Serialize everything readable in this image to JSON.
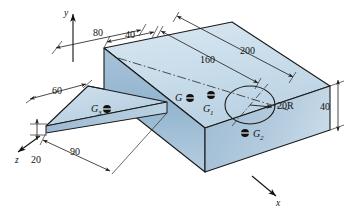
{
  "figure": {
    "axes": [
      {
        "name": "y-axis-label",
        "label": "y"
      },
      {
        "name": "x-axis-label",
        "label": "x"
      },
      {
        "name": "z-axis-label",
        "label": "z"
      }
    ],
    "dimensions": [
      {
        "name": "dim-80",
        "label": "80"
      },
      {
        "name": "dim-40-top",
        "label": "40"
      },
      {
        "name": "dim-160",
        "label": "160"
      },
      {
        "name": "dim-200",
        "label": "200"
      },
      {
        "name": "dim-60",
        "label": "60"
      },
      {
        "name": "dim-90",
        "label": "90"
      },
      {
        "name": "dim-20",
        "label": "20"
      },
      {
        "name": "dim-40-right",
        "label": "40"
      }
    ],
    "callouts": [
      {
        "name": "radius-callout",
        "label": "20R"
      }
    ],
    "centroids": [
      {
        "name": "centroid-G",
        "label": "G",
        "sub": ""
      },
      {
        "name": "centroid-G1",
        "label": "G",
        "sub": "1"
      },
      {
        "name": "centroid-G2",
        "label": "G",
        "sub": "2"
      },
      {
        "name": "centroid-G3",
        "label": "G",
        "sub": "3"
      }
    ],
    "colors": {
      "top_face": "#ccdeeb",
      "front_face": "#8fb2cd",
      "side_face": "#a9c4da",
      "wedge_top": "#bdd4e4",
      "line": "#1a1a1a",
      "dim_line": "#2a2a2a",
      "background": "#ffffff"
    }
  }
}
